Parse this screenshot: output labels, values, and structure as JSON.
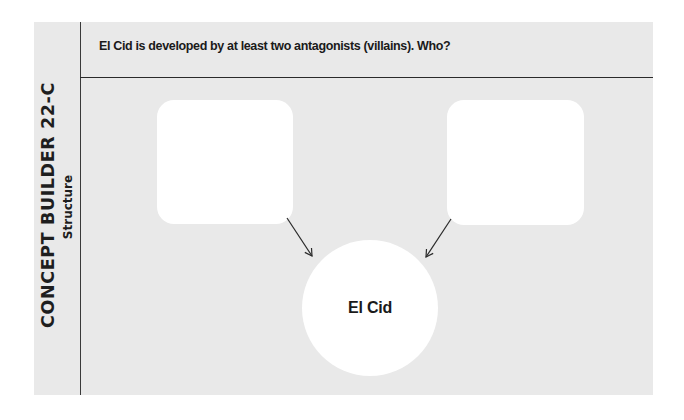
{
  "sidebar": {
    "title": "CONCEPT BUILDER 22-C",
    "subtitle": "Structure"
  },
  "header": {
    "prompt": "El Cid is developed by at least two antagonists (villains). Who?"
  },
  "diagram": {
    "left_box": {
      "label": "",
      "role": "antagonist-1"
    },
    "right_box": {
      "label": "",
      "role": "antagonist-2"
    },
    "center": {
      "label": "El Cid"
    }
  },
  "colors": {
    "panel_background": "#e9e9e9",
    "page_background": "#ffffff",
    "shape_fill": "#ffffff",
    "line": "#2a2a2a",
    "text": "#1a1a1a"
  }
}
